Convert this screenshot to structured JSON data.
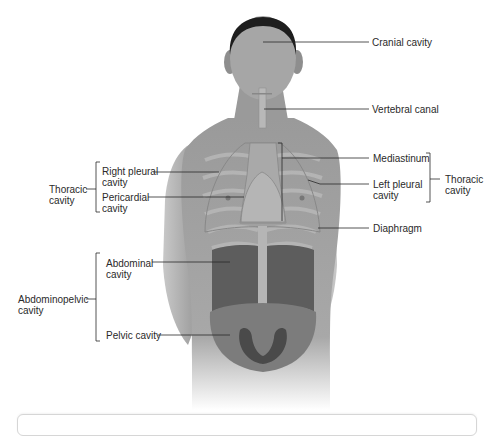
{
  "figure": {
    "labels": [
      {
        "id": "cranial",
        "text": "Cranial cavity",
        "x": 372,
        "y": 38
      },
      {
        "id": "vertebral",
        "text": "Vertebral canal",
        "x": 372,
        "y": 104
      },
      {
        "id": "mediastinum",
        "text": "Mediastinum",
        "x": 373,
        "y": 153
      },
      {
        "id": "left-pleural",
        "text": "Left pleural\ncavity",
        "x": 373,
        "y": 180
      },
      {
        "id": "diaphragm",
        "text": "Diaphragm",
        "x": 373,
        "y": 224
      },
      {
        "id": "thoracic-right",
        "text": "Thoracic\ncavity",
        "x": 445,
        "y": 174
      },
      {
        "id": "right-pleural",
        "text": "Right pleural\ncavity",
        "x": 102,
        "y": 165
      },
      {
        "id": "pericardial",
        "text": "Pericardial\ncavity",
        "x": 102,
        "y": 190
      },
      {
        "id": "thoracic-left",
        "text": "Thoracic\ncavity",
        "x": 49,
        "y": 184
      },
      {
        "id": "abdominal",
        "text": "Abdominal\ncavity",
        "x": 106,
        "y": 257
      },
      {
        "id": "abdominopelvic",
        "text": "Abdominopelvic\ncavity",
        "x": 18,
        "y": 294
      },
      {
        "id": "pelvic",
        "text": "Pelvic cavity",
        "x": 106,
        "y": 330
      }
    ]
  },
  "colors": {
    "skin": "#9c9c9c",
    "skin_light": "#c4c4c4",
    "hair": "#1e1e1e",
    "cavity_dark": "#5a5a5a",
    "cavity_mid": "#7a7a7a",
    "bone": "#b8b8b8",
    "line": "#2a2a2a"
  }
}
